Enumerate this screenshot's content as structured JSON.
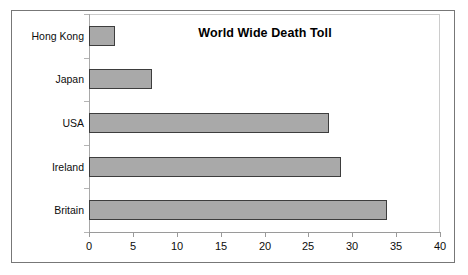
{
  "chart_data": {
    "type": "bar",
    "orientation": "horizontal",
    "title": "World Wide Death Toll",
    "xlabel": "",
    "ylabel": "",
    "categories": [
      "Hong Kong",
      "Japan",
      "USA",
      "Ireland",
      "Britain"
    ],
    "values": [
      3,
      7.2,
      27.4,
      28.7,
      34
    ],
    "xlim": [
      0,
      40
    ],
    "xticks": [
      0,
      5,
      10,
      15,
      20,
      25,
      30,
      35,
      40
    ],
    "xtick_labels": [
      "0",
      "5",
      "10",
      "15",
      "20",
      "25",
      "30",
      "35",
      "40"
    ],
    "grid": false,
    "legend": null,
    "series": [
      {
        "name": "Death Toll",
        "values": [
          3,
          7.2,
          27.4,
          28.7,
          34
        ],
        "color": "#a9a9a9",
        "border_color": "#3d3d3d"
      }
    ]
  },
  "colors": {
    "bar_fill": "#a9a9a9",
    "bar_border": "#3d3d3d",
    "frame": "#777777",
    "axis": "#9a9a9a",
    "text": "#0d0d0d",
    "background": "#ffffff"
  }
}
